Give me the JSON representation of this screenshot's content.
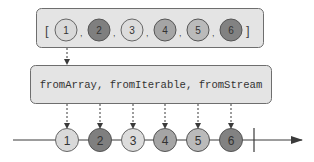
{
  "source_array": {
    "open_bracket": "[",
    "close_bracket": "]",
    "separator": ",",
    "items": [
      {
        "label": "1",
        "fill": "#d9d9d9"
      },
      {
        "label": "2",
        "fill": "#7f7f7f"
      },
      {
        "label": "3",
        "fill": "#dcdcdc"
      },
      {
        "label": "4",
        "fill": "#a5a5a5"
      },
      {
        "label": "5",
        "fill": "#bababa"
      },
      {
        "label": "6",
        "fill": "#828282"
      }
    ]
  },
  "operator": {
    "label": "fromArray, fromIterable, fromStream"
  },
  "timeline": {
    "emissions": [
      {
        "label": "1",
        "fill": "#d9d9d9"
      },
      {
        "label": "2",
        "fill": "#7f7f7f"
      },
      {
        "label": "3",
        "fill": "#dcdcdc"
      },
      {
        "label": "4",
        "fill": "#a5a5a5"
      },
      {
        "label": "5",
        "fill": "#bababa"
      },
      {
        "label": "6",
        "fill": "#828282"
      }
    ],
    "completion_marker": "completed"
  },
  "colors": {
    "box_fill": "#e4e4e4",
    "box_stroke": "#6e6e6e",
    "line": "#3a3a3a",
    "text": "#333333"
  }
}
